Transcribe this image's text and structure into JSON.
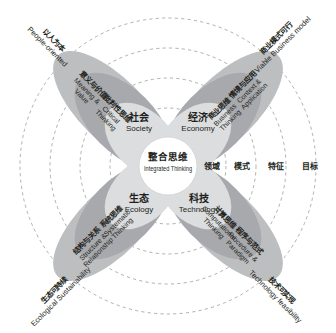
{
  "diagram": {
    "title_zh": "整合思维",
    "title_en": "Integrated Thinking",
    "core": {
      "label_zh": "整合思维",
      "label_en": "Integrated Thinking"
    },
    "domains": [
      {
        "id": "society",
        "label_zh": "社会",
        "label_en": "Society",
        "position": "top-left"
      },
      {
        "id": "economy",
        "label_zh": "经济",
        "label_en": "Economy",
        "position": "top-right"
      },
      {
        "id": "ecology",
        "label_zh": "生态",
        "label_en": "Ecology",
        "position": "bottom-left"
      },
      {
        "id": "technology",
        "label_zh": "科技",
        "label_en": "Technology",
        "position": "bottom-right"
      }
    ],
    "petals": [
      {
        "id": "people-petal",
        "position": "top-left",
        "inner": {
          "label_zh": "批判性思维",
          "label_en": "Critical Thinking"
        },
        "outer": {
          "label_zh": "意义与价值",
          "label_en": "Meaning & Value"
        },
        "goal": {
          "label_zh": "以人为本",
          "label_en": "People-oriented"
        },
        "color_inner": "#a6a8ab",
        "color_outer": "#bcbec0"
      },
      {
        "id": "business-petal",
        "position": "top-right",
        "inner": {
          "label_zh": "商业思维",
          "label_en": "Business Thinking"
        },
        "outer": {
          "label_zh": "情境与应用",
          "label_en": "Context & Application"
        },
        "goal": {
          "label_zh": "商业模式可行",
          "label_en": "Viable Business model"
        },
        "color_inner": "#a6a8ab",
        "color_outer": "#bcbec0"
      },
      {
        "id": "ecology-petal",
        "position": "bottom-left",
        "inner": {
          "label_zh": "系统思维",
          "label_en": "Systematic Thinking"
        },
        "outer": {
          "label_zh": "结构与关系",
          "label_en": "Structure & Relationship"
        },
        "goal": {
          "label_zh": "生态可持续",
          "label_en": "Ecological Sustainability"
        },
        "color_inner": "#a6a8ab",
        "color_outer": "#bcbec0"
      },
      {
        "id": "technology-petal",
        "position": "bottom-right",
        "inner": {
          "label_zh": "计算思维",
          "label_en": "Computational Thinking"
        },
        "outer": {
          "label_zh": "程序与范式",
          "label_en": "Procedure & Paradigm"
        },
        "goal": {
          "label_zh": "技术可实现",
          "label_en": "Technology feasibility"
        },
        "color_inner": "#a6a8ab",
        "color_outer": "#bcbec0"
      }
    ],
    "ring_legend": [
      {
        "id": "ring-domain",
        "label_zh": "领域"
      },
      {
        "id": "ring-mode",
        "label_zh": "模式"
      },
      {
        "id": "ring-feature",
        "label_zh": "特征"
      },
      {
        "id": "ring-goal",
        "label_zh": "目标"
      }
    ],
    "colors": {
      "background": "#ffffff",
      "core_fill": "#ffffff",
      "domain_fill": "#dcdddf",
      "petal_inner_fill": "#a7a9ac",
      "petal_outer_fill": "#bcbec0",
      "ring_stroke": "#939598",
      "text": "#231f20"
    }
  }
}
